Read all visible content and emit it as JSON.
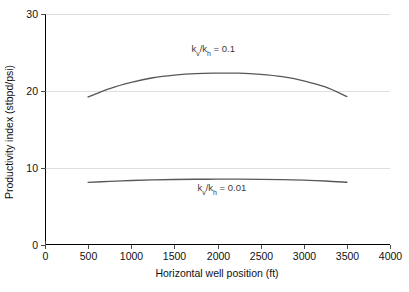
{
  "chart_data": {
    "type": "line",
    "title": "",
    "xlabel": "Horizontal well position (ft)",
    "ylabel": "Productivity index (stbpd/psi)",
    "xlim": [
      0,
      4000
    ],
    "ylim": [
      0,
      30
    ],
    "xticks": [
      0,
      500,
      1000,
      1500,
      2000,
      2500,
      3000,
      3500,
      4000
    ],
    "xtick_labels": [
      "0",
      "500",
      "1000",
      "1500",
      "2000",
      "2500",
      "3000",
      "3500",
      "4000"
    ],
    "yticks": [
      0,
      10,
      20,
      30
    ],
    "ytick_labels": [
      "0",
      "10",
      "20",
      "30"
    ],
    "grid": "horizontal",
    "legend_position": "inline-annotation",
    "x": [
      500,
      750,
      1000,
      1250,
      1500,
      1750,
      2000,
      2250,
      2500,
      2750,
      3000,
      3250,
      3500
    ],
    "series": [
      {
        "name": "kv/kh = 0.1",
        "label_html": "k<sub>v</sub>/k<sub>h</sub> = 0.1",
        "label_prefix": "k",
        "label_sub1": "v",
        "label_mid": "/k",
        "label_sub2": "h",
        "label_suffix": " = 0.1",
        "color": "#585858",
        "values": [
          19.2,
          20.3,
          21.1,
          21.7,
          22.05,
          22.25,
          22.3,
          22.3,
          22.15,
          21.85,
          21.3,
          20.5,
          19.25
        ]
      },
      {
        "name": "kv/kh = 0.01",
        "label_html": "k<sub>v</sub>/k<sub>h</sub> = 0.01",
        "label_prefix": "k",
        "label_sub1": "v",
        "label_mid": "/k",
        "label_sub2": "h",
        "label_suffix": " = 0.01",
        "color": "#585858",
        "values": [
          8.08,
          8.22,
          8.33,
          8.41,
          8.46,
          8.49,
          8.5,
          8.5,
          8.48,
          8.44,
          8.38,
          8.27,
          8.1
        ]
      }
    ],
    "annotations": [
      {
        "text": "kv/kh = 0.1",
        "x": 1950,
        "y": 25.0
      },
      {
        "text": "kv/kh = 0.01",
        "x": 2050,
        "y": 7.0
      }
    ],
    "colors": {
      "curve": "#585858",
      "grid": "#dedede",
      "axis": "#000000",
      "text": "#111111",
      "background": "#ffffff"
    }
  }
}
